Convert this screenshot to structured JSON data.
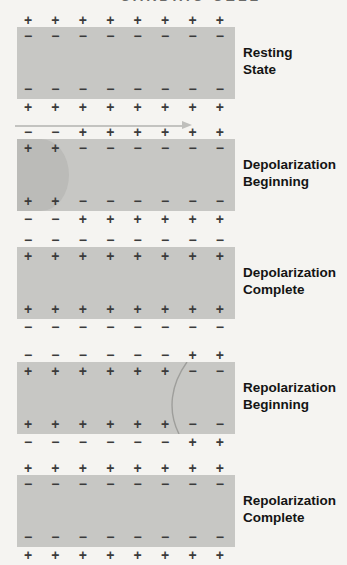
{
  "title": {
    "text": "CARDIAC CELL"
  },
  "colors": {
    "background": "#f5f4f1",
    "cell_bar": "#c7c7c4",
    "depolarized_region": "#bbbbb8",
    "charge_sign": "#3b3b3b",
    "label_text": "#141414",
    "arrow": "#c3c3c0"
  },
  "panels": [
    {
      "label_line1": "Resting",
      "label_line2": "State",
      "outside_top": [
        "+",
        "+",
        "+",
        "+",
        "+",
        "+",
        "+",
        "+"
      ],
      "inside_top": [
        "−",
        "−",
        "−",
        "−",
        "−",
        "−",
        "−",
        "−"
      ],
      "inside_bottom": [
        "−",
        "−",
        "−",
        "−",
        "−",
        "−",
        "−",
        "−"
      ],
      "outside_bottom": [
        "+",
        "+",
        "+",
        "+",
        "+",
        "+",
        "+",
        "+"
      ],
      "wavefront": "none"
    },
    {
      "label_line1": "Depolarization",
      "label_line2": "Beginning",
      "outside_top": [
        "−",
        "−",
        "+",
        "+",
        "+",
        "+",
        "+",
        "+"
      ],
      "inside_top": [
        "+",
        "+",
        "−",
        "−",
        "−",
        "−",
        "−",
        "−"
      ],
      "inside_bottom": [
        "+",
        "+",
        "−",
        "−",
        "−",
        "−",
        "−",
        "−"
      ],
      "outside_bottom": [
        "−",
        "−",
        "+",
        "+",
        "+",
        "+",
        "+",
        "+"
      ],
      "wavefront": "darker-left-region-convex-right"
    },
    {
      "label_line1": "Depolarization",
      "label_line2": "Complete",
      "outside_top": [
        "−",
        "−",
        "−",
        "−",
        "−",
        "−",
        "−",
        "−"
      ],
      "inside_top": [
        "+",
        "+",
        "+",
        "+",
        "+",
        "+",
        "+",
        "+"
      ],
      "inside_bottom": [
        "+",
        "+",
        "+",
        "+",
        "+",
        "+",
        "+",
        "+"
      ],
      "outside_bottom": [
        "−",
        "−",
        "−",
        "−",
        "−",
        "−",
        "−",
        "−"
      ],
      "wavefront": "none"
    },
    {
      "label_line1": "Repolarization",
      "label_line2": "Beginning",
      "outside_top": [
        "−",
        "−",
        "−",
        "−",
        "−",
        "−",
        "+",
        "+"
      ],
      "inside_top": [
        "+",
        "+",
        "+",
        "+",
        "+",
        "+",
        "−",
        "−"
      ],
      "inside_bottom": [
        "+",
        "+",
        "+",
        "+",
        "+",
        "+",
        "−",
        "−"
      ],
      "outside_bottom": [
        "−",
        "−",
        "−",
        "−",
        "−",
        "−",
        "+",
        "+"
      ],
      "wavefront": "thin-arc-convex-left"
    },
    {
      "label_line1": "Repolarization",
      "label_line2": "Complete",
      "outside_top": [
        "+",
        "+",
        "+",
        "+",
        "+",
        "+",
        "+",
        "+"
      ],
      "inside_top": [
        "−",
        "−",
        "−",
        "−",
        "−",
        "−",
        "−",
        "−"
      ],
      "inside_bottom": [
        "−",
        "−",
        "−",
        "−",
        "−",
        "−",
        "−",
        "−"
      ],
      "outside_bottom": [
        "+",
        "+",
        "+",
        "+",
        "+",
        "+",
        "+",
        "+"
      ],
      "wavefront": "none"
    }
  ]
}
